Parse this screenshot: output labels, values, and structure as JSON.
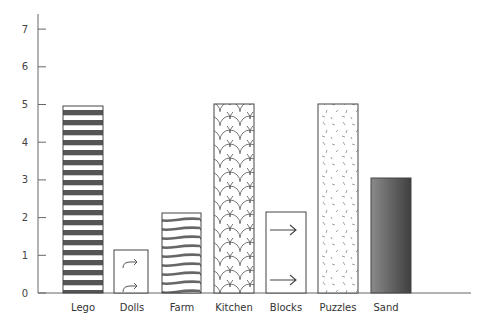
{
  "chart_data": {
    "type": "bar",
    "title": "",
    "xlabel": "",
    "ylabel": "",
    "categories": [
      "Lego",
      "Dolls",
      "Farm",
      "Kitchen",
      "Blocks",
      "Puzzles",
      "Sand"
    ],
    "values": [
      5,
      1,
      2,
      5,
      2,
      5,
      3
    ],
    "ylim": [
      0,
      7.5
    ],
    "yticks": [
      0,
      1,
      2,
      3,
      4,
      5,
      6,
      7
    ],
    "grid": false,
    "legend": null,
    "bar_patterns": [
      "horizontal-stripes",
      "arrows-curved",
      "waves",
      "scales",
      "arrows-straight",
      "dashes",
      "gradient"
    ]
  },
  "colors": {
    "axis": "#666666",
    "bar_border": "#444444",
    "stripe": "#555555",
    "gradient_light": "#8a8a8a",
    "gradient_dark": "#3f3f3f"
  }
}
